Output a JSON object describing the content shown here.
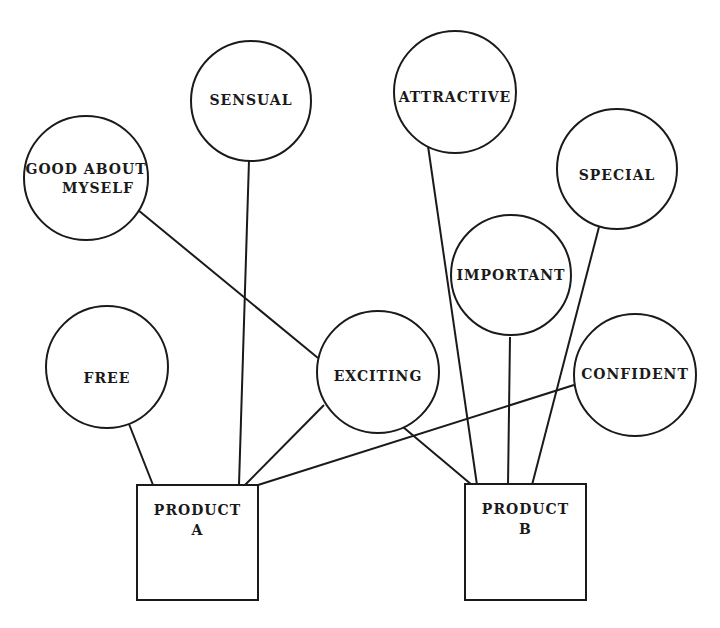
{
  "diagram": {
    "type": "concept-network",
    "attributes": [
      {
        "id": "sensual",
        "label": [
          "SENSUAL"
        ],
        "cx": 251,
        "cy": 101,
        "r": 60,
        "ty": 100
      },
      {
        "id": "good-about-myself",
        "label": [
          "GOOD ABOUT",
          "MYSELF"
        ],
        "cx": 86,
        "cy": 178,
        "r": 62,
        "ty": 178
      },
      {
        "id": "attractive",
        "label": [
          "ATTRACTIVE"
        ],
        "cx": 455,
        "cy": 92,
        "r": 61,
        "ty": 97
      },
      {
        "id": "special",
        "label": [
          "SPECIAL"
        ],
        "cx": 617,
        "cy": 169,
        "r": 60,
        "ty": 175
      },
      {
        "id": "important",
        "label": [
          "IMPORTANT"
        ],
        "cx": 511,
        "cy": 275,
        "r": 60,
        "ty": 275
      },
      {
        "id": "free",
        "label": [
          "FREE"
        ],
        "cx": 107,
        "cy": 367,
        "r": 61,
        "ty": 378
      },
      {
        "id": "exciting",
        "label": [
          "EXCITING"
        ],
        "cx": 378,
        "cy": 372,
        "r": 61,
        "ty": 376
      },
      {
        "id": "confident",
        "label": [
          "CONFIDENT"
        ],
        "cx": 635,
        "cy": 375,
        "r": 61,
        "ty": 374
      }
    ],
    "products": [
      {
        "id": "product-a",
        "label": [
          "PRODUCT",
          "A"
        ],
        "x": 137,
        "y": 485,
        "w": 121,
        "h": 115
      },
      {
        "id": "product-b",
        "label": [
          "PRODUCT",
          "B"
        ],
        "x": 465,
        "y": 484,
        "w": 121,
        "h": 116
      }
    ],
    "connections": [
      {
        "from": "good-about-myself",
        "to": "exciting",
        "x1": 138,
        "y1": 210,
        "x2": 318,
        "y2": 358
      },
      {
        "from": "sensual",
        "to": "product-a",
        "x1": 249,
        "y1": 160,
        "x2": 239,
        "y2": 485
      },
      {
        "from": "free",
        "to": "product-a",
        "x1": 129,
        "y1": 424,
        "x2": 153,
        "y2": 485
      },
      {
        "from": "exciting",
        "to": "product-a",
        "x1": 324,
        "y1": 405,
        "x2": 245,
        "y2": 485
      },
      {
        "from": "confident",
        "to": "product-a",
        "x1": 574,
        "y1": 385,
        "x2": 258,
        "y2": 485
      },
      {
        "from": "exciting",
        "to": "product-b",
        "x1": 403,
        "y1": 427,
        "x2": 472,
        "y2": 485
      },
      {
        "from": "attractive",
        "to": "product-b",
        "x1": 428,
        "y1": 146,
        "x2": 477,
        "y2": 485
      },
      {
        "from": "important",
        "to": "product-b",
        "x1": 510,
        "y1": 337,
        "x2": 508,
        "y2": 485
      },
      {
        "from": "special",
        "to": "product-b",
        "x1": 599,
        "y1": 227,
        "x2": 532,
        "y2": 485
      }
    ],
    "colors": {
      "stroke": "#1a1a1a",
      "background": "#ffffff"
    }
  }
}
